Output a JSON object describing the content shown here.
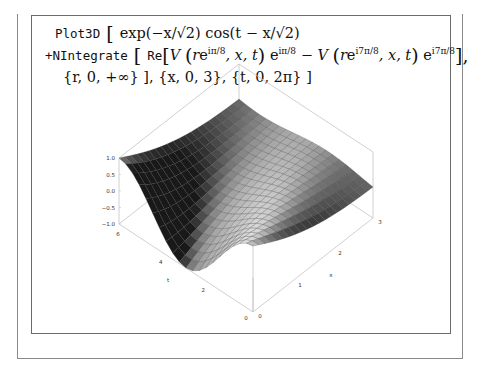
{
  "formula": {
    "line1": {
      "cmd": "Plot3D",
      "open": " [ ",
      "expr": "exp(−x/√2) cos(t − x/√2)"
    },
    "line2": {
      "cmd": "+NIntegrate",
      "open": " [ ",
      "re": "Re",
      "term1_V": "V",
      "term1_arg_r": "r",
      "term1_arg_sup": "iπ/8",
      "term1_rest": ", x, t",
      "term1_factor_base": "e",
      "term1_factor_sup": "iπ/8",
      "minus": " − ",
      "term2_V": "V",
      "term2_arg_r": "r",
      "term2_arg_sup": "i7π/8",
      "term2_rest": ", x, t",
      "term2_factor_base": "e",
      "term2_factor_sup": "i7π/8",
      "close": "],"
    },
    "line3": {
      "text": "{r, 0, +∞} ], {x, 0, 3}, {t, 0, 2π} ]"
    }
  },
  "chart_data": {
    "type": "surface3d",
    "title": "",
    "function": "exp(-x/sqrt(2))*cos(t - x/sqrt(2)) + NIntegrate[...]",
    "x_range": [
      0,
      3
    ],
    "t_range": [
      0,
      6.283
    ],
    "z_range": [
      -1.0,
      1.0
    ],
    "z_ticks": [
      "1.0",
      "0.5",
      "0.0",
      "−0.5",
      "−1.0"
    ],
    "x_ticks": [
      "0",
      "1",
      "2",
      "3"
    ],
    "t_ticks": [
      "0",
      "2",
      "4",
      "6"
    ],
    "x_axis_label": "x",
    "t_axis_label": "t",
    "mesh_lines": 20,
    "surface_color": "#b8b8b8",
    "box": true
  },
  "colors": {
    "frame": "#8a8a8a",
    "box_edge": "#c4c4c4",
    "mesh": "#3a3a3a"
  }
}
